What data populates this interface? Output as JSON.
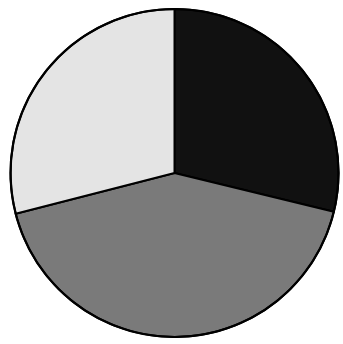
{
  "chart_data": {
    "type": "pie",
    "title": "",
    "categories": [
      "Black slice",
      "Gray slice",
      "Light slice"
    ],
    "values": [
      28.8,
      42.2,
      29.0
    ],
    "colors": [
      "#111111",
      "#7a7a7a",
      "#e4e4e4"
    ],
    "start_angle_deg": 90,
    "direction": "clockwise",
    "legend": "none",
    "labels_shown": false,
    "edge_color": "#000000"
  },
  "layout": {
    "cx": 174.5,
    "cy": 173,
    "r": 164
  }
}
